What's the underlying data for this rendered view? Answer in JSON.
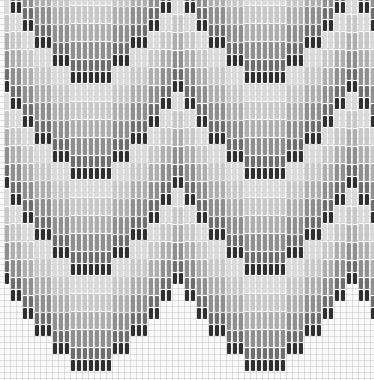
{
  "figure": {
    "title": "",
    "width": 374,
    "height": 380
  },
  "pattern": {
    "column_pitch": 6,
    "first_column_x": 5,
    "stitch_width": 4,
    "unit": 6,
    "period_columns": 29,
    "half_profile_units": [
      0,
      0,
      0,
      0,
      1,
      1,
      1,
      2,
      2,
      2,
      3,
      3,
      4,
      4,
      5
    ],
    "trough_column_index": 14,
    "band_order": [
      {
        "name": "dark-outline",
        "color": "#2f2f2f",
        "units": 2
      },
      {
        "name": "mid-dark",
        "color": "#6e6e6e",
        "units": 2
      },
      {
        "name": "mid-gray",
        "color": "#8f8f8f",
        "units": 3
      },
      {
        "name": "light-gray",
        "color": "#aeaeae",
        "units": 3
      },
      {
        "name": "pale",
        "color": "#c8c8c8",
        "units": 3
      },
      {
        "name": "lightest",
        "color": "#dadada",
        "units": 3
      }
    ],
    "bottom_edge_min_y": 285,
    "bottom_edge_max_y": 372,
    "background_grid_color": "#cccccc"
  }
}
